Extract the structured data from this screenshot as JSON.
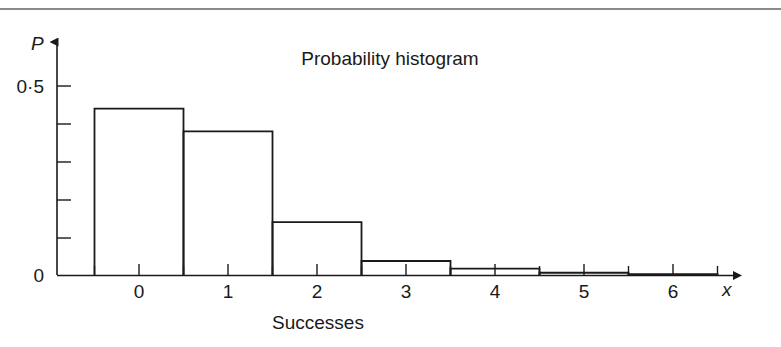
{
  "chart_data": {
    "type": "bar",
    "title": "Probability histogram",
    "xlabel": "Successes",
    "ylabel": "P",
    "x_axis_name": "x",
    "categories": [
      "0",
      "1",
      "2",
      "3",
      "4",
      "5",
      "6"
    ],
    "values": [
      0.44,
      0.38,
      0.14,
      0.037,
      0.017,
      0.006,
      0.002
    ],
    "xlim": [
      -0.62,
      6.62
    ],
    "ylim": [
      0,
      0.56
    ],
    "y_tick_labels": [
      "0",
      "0·5"
    ],
    "y_tick_values": [
      0,
      0.1,
      0.2,
      0.3,
      0.4,
      0.5
    ],
    "y_labeled_ticks": [
      0,
      0.5
    ],
    "x_tick_values": [
      0,
      1,
      2,
      3,
      4,
      5,
      6
    ],
    "x_minor_tick_values": [
      -0.5,
      0.5,
      1.5,
      2.5,
      3.5,
      4.5,
      5.5,
      6.5
    ],
    "grid": false,
    "legend": "none",
    "bar_width": 1,
    "bar_style": "outline",
    "colors": {
      "stroke": "#1a1a1a",
      "fill": "none",
      "rule": "#8a8a8a",
      "background": "#ffffff"
    }
  },
  "figure": {
    "title_text": "Probability histogram",
    "caption_text": "Successes",
    "y_axis_symbol": "P",
    "x_axis_symbol": "x",
    "y_label_zero": "0",
    "y_label_half": "0·5",
    "x_labels": [
      "0",
      "1",
      "2",
      "3",
      "4",
      "5",
      "6"
    ]
  }
}
